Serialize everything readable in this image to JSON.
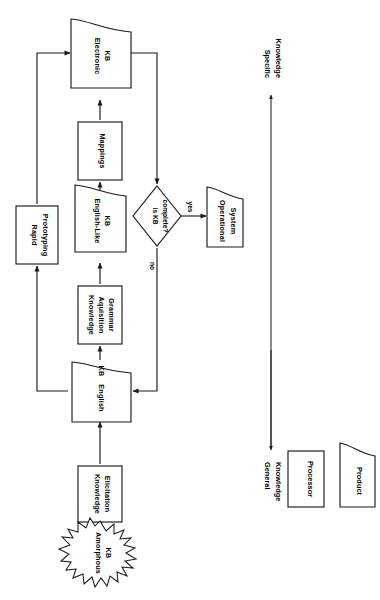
{
  "diagram": {
    "orientation": "rotated-90-clockwise",
    "background_color": "#ffffff",
    "line_color": "#1a1a1a",
    "nodes": [
      {
        "id": "amorphous_kb",
        "label_line1": "Amorphous",
        "label_line2": "KB",
        "label_line3": "",
        "shape": "starburst"
      },
      {
        "id": "knowledge_elicitation",
        "label_line1": "Knowledge",
        "label_line2": "Elicitation",
        "label_line3": "",
        "shape": "processor"
      },
      {
        "id": "english_kb",
        "label_line1": "English",
        "label_line2": "KB",
        "label_line3": "",
        "shape": "product"
      },
      {
        "id": "ka_grammar",
        "label_line1": "Knowledge",
        "label_line2": "Aquisition",
        "label_line3": "Grammar",
        "shape": "processor"
      },
      {
        "id": "english_like_kb",
        "label_line1": "English-Like",
        "label_line2": "KB",
        "label_line3": "",
        "shape": "product"
      },
      {
        "id": "mappings",
        "label_line1": "Mappings",
        "label_line2": "",
        "label_line3": "",
        "shape": "processor"
      },
      {
        "id": "electronic_kb",
        "label_line1": "Electronic",
        "label_line2": "KB",
        "label_line3": "",
        "shape": "product"
      },
      {
        "id": "rapid_prototyping",
        "label_line1": "Rapid",
        "label_line2": "Prototyping",
        "label_line3": "",
        "shape": "processor"
      },
      {
        "id": "is_kb_complete",
        "label_line1": "is KB",
        "label_line2": "complete?",
        "label_line3": "",
        "shape": "decision"
      },
      {
        "id": "operational_system",
        "label_line1": "Operational",
        "label_line2": "System",
        "label_line3": "",
        "shape": "product"
      }
    ],
    "edge_labels": {
      "yes": "yes",
      "no": "no"
    },
    "axis": {
      "top_label_line1": "Specific",
      "top_label_line2": "Knowledge",
      "bottom_label_line1": "General",
      "bottom_label_line2": "Knowledge"
    },
    "legend": [
      {
        "id": "legend_processor",
        "label": "Processor",
        "shape": "processor"
      },
      {
        "id": "legend_product",
        "label": "Product",
        "shape": "product"
      }
    ]
  }
}
